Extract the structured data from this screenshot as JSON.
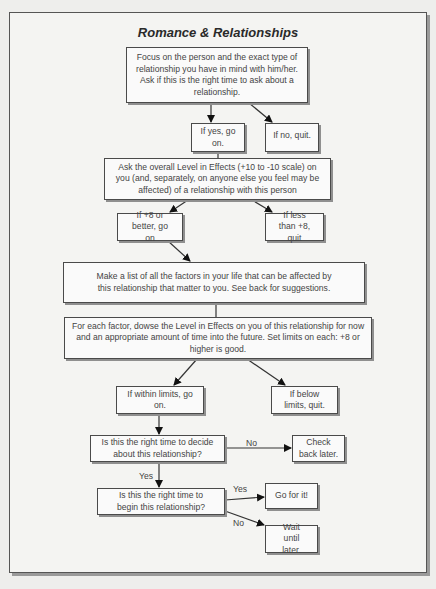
{
  "title": "Romance & Relationships",
  "nodes": {
    "focus": "Focus on the person and the exact type of relationship you have in mind with him/her. Ask if this is the right time to ask about a relationship.",
    "if_yes": "If yes, go on.",
    "if_no": "If no, quit.",
    "ask_level": "Ask the overall Level in Effects (+10 to -10 scale) on you (and, separately, on anyone else you feel may be affected) of a relationship with this person",
    "plus8": "If +8 or  better, go on",
    "less8": "If less than +8, quit",
    "make_list": "Make a list of all the factors in your life that can be affected by this relationship that matter to you. See back for suggestions.",
    "each_factor": "For each factor, dowse the Level in Effects on you of this relationship for now and an appropriate amount of time into the future. Set limits on each: +8 or higher is good.",
    "within": "If within limits, go on.",
    "below": "If below limits, quit.",
    "decide": "Is this the right time to decide about this relationship?",
    "check_back": "Check back later.",
    "begin": "Is this the right time to begin this relationship?",
    "go": "Go for it!",
    "wait": "Wait until later."
  },
  "edge_labels": {
    "decide_no": "No",
    "decide_yes": "Yes",
    "begin_yes": "Yes",
    "begin_no": "No"
  }
}
